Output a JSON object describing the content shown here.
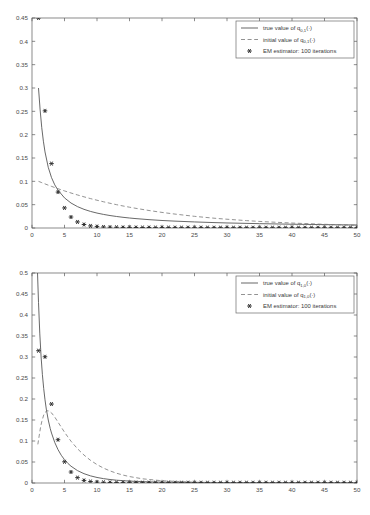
{
  "page": {
    "background": "#ffffff",
    "width": 370,
    "height": 515
  },
  "figures": [
    {
      "id": "figure-1",
      "legend": {
        "entries": [
          {
            "label_prefix": "true value of q",
            "subscript": "0,1",
            "label_suffix": "(·)",
            "marker": "solid-line"
          },
          {
            "label_prefix": "initial value of q",
            "subscript": "0,1",
            "label_suffix": "(·)",
            "marker": "dashed-line"
          },
          {
            "label_prefix": "EM estimator: 100 iterations",
            "subscript": "",
            "label_suffix": "",
            "marker": "star-point"
          }
        ]
      }
    },
    {
      "id": "figure-2",
      "legend": {
        "entries": [
          {
            "label_prefix": "true value of q",
            "subscript": "1,0",
            "label_suffix": "(·)",
            "marker": "solid-line"
          },
          {
            "label_prefix": "initial value of q",
            "subscript": "1,0",
            "label_suffix": "(·)",
            "marker": "dashed-line"
          },
          {
            "label_prefix": "EM estimator: 100 iterations",
            "subscript": "",
            "label_suffix": "",
            "marker": "star-point"
          }
        ]
      }
    }
  ],
  "chart_data": [
    {
      "type": "line",
      "title": "",
      "xlabel": "",
      "ylabel": "",
      "xlim": [
        0,
        50
      ],
      "ylim": [
        0,
        0.45
      ],
      "xticks": [
        0,
        5,
        10,
        15,
        20,
        25,
        30,
        35,
        40,
        45,
        50
      ],
      "yticks": [
        0,
        0.05,
        0.1,
        0.15,
        0.2,
        0.25,
        0.3,
        0.35,
        0.4,
        0.45
      ],
      "grid": false,
      "legend_position": "top-right",
      "colors": {
        "true": "#4d4d4d",
        "initial": "#777777",
        "estimator": "#2b2b2b"
      },
      "series": [
        {
          "name": "true value of q_{0,1}(·)",
          "style": "solid",
          "x": [
            1,
            1.25,
            1.5,
            1.75,
            2,
            2.5,
            3,
            3.5,
            4,
            5,
            6,
            7,
            8,
            9,
            10,
            11,
            12,
            13,
            14,
            15,
            16,
            18,
            20,
            22,
            25,
            28,
            30,
            35,
            40,
            45,
            50
          ],
          "y": [
            0.3,
            0.253,
            0.215,
            0.186,
            0.163,
            0.13,
            0.108,
            0.0925,
            0.081,
            0.0645,
            0.0535,
            0.0458,
            0.04,
            0.0355,
            0.032,
            0.0291,
            0.0267,
            0.0247,
            0.0229,
            0.0214,
            0.0201,
            0.0179,
            0.0161,
            0.0147,
            0.013,
            0.0116,
            0.0108,
            0.0093,
            0.0081,
            0.0072,
            0.0065
          ]
        },
        {
          "name": "initial value of q_{0,1}(·)",
          "style": "dashed",
          "x": [
            1,
            1.5,
            2,
            2.5,
            3,
            4,
            5,
            6,
            7,
            8,
            9,
            10,
            11,
            12,
            13,
            14,
            15,
            16,
            18,
            20,
            22,
            25,
            28,
            30,
            33,
            36,
            40,
            44,
            47,
            50
          ],
          "y": [
            0.1,
            0.0972,
            0.0945,
            0.0918,
            0.0892,
            0.0842,
            0.0795,
            0.075,
            0.0708,
            0.0668,
            0.063,
            0.0595,
            0.0562,
            0.053,
            0.05,
            0.0472,
            0.0446,
            0.0421,
            0.0375,
            0.0334,
            0.0298,
            0.025,
            0.021,
            0.0188,
            0.0158,
            0.0133,
            0.0106,
            0.0084,
            0.007,
            0.0059
          ]
        },
        {
          "name": "EM estimator: 100 iterations",
          "style": "points",
          "x": [
            1,
            2,
            3,
            4,
            5,
            6,
            7,
            8,
            9,
            10,
            11,
            12,
            13,
            14,
            15,
            16,
            17,
            18,
            19,
            20,
            21,
            22,
            23,
            24,
            25,
            26,
            27,
            28,
            29,
            30,
            31,
            32,
            33,
            34,
            35,
            36,
            37,
            38,
            39,
            40,
            41,
            42,
            43,
            44,
            45,
            46,
            47,
            48,
            49,
            50
          ],
          "y": [
            0.45,
            0.251,
            0.138,
            0.077,
            0.043,
            0.0235,
            0.013,
            0.0075,
            0.0045,
            0.003,
            0.0022,
            0.0018,
            0.0015,
            0.0013,
            0.0012,
            0.0011,
            0.001,
            0.001,
            0.0009,
            0.0009,
            0.0009,
            0.0008,
            0.0008,
            0.0008,
            0.0008,
            0.0008,
            0.0008,
            0.0007,
            0.0007,
            0.0007,
            0.0007,
            0.0007,
            0.0007,
            0.0007,
            0.0007,
            0.0007,
            0.0007,
            0.0007,
            0.0007,
            0.0007,
            0.0007,
            0.0007,
            0.0007,
            0.0007,
            0.0007,
            0.0007,
            0.0007,
            0.0007,
            0.0007,
            0.0007
          ]
        }
      ]
    },
    {
      "type": "line",
      "title": "",
      "xlabel": "",
      "ylabel": "",
      "xlim": [
        0,
        50
      ],
      "ylim": [
        0,
        0.5
      ],
      "xticks": [
        0,
        5,
        10,
        15,
        20,
        25,
        30,
        35,
        40,
        45,
        50
      ],
      "yticks": [
        0,
        0.05,
        0.1,
        0.15,
        0.2,
        0.25,
        0.3,
        0.35,
        0.4,
        0.45,
        0.5
      ],
      "grid": false,
      "legend_position": "top-right",
      "colors": {
        "true": "#4d4d4d",
        "initial": "#777777",
        "estimator": "#2b2b2b"
      },
      "series": [
        {
          "name": "true value of q_{1,0}(·)",
          "style": "solid",
          "x": [
            0.85,
            1,
            1.2,
            1.4,
            1.6,
            1.8,
            2,
            2.2,
            2.5,
            2.8,
            3,
            3.5,
            4,
            4.5,
            5,
            5.5,
            6,
            7,
            8,
            9,
            10,
            11,
            12,
            13,
            15,
            18,
            20,
            25,
            30,
            35,
            40,
            45,
            50
          ],
          "y": [
            0.5,
            0.43,
            0.355,
            0.3,
            0.258,
            0.225,
            0.198,
            0.176,
            0.15,
            0.13,
            0.119,
            0.0965,
            0.0795,
            0.066,
            0.0555,
            0.047,
            0.04,
            0.0295,
            0.0222,
            0.017,
            0.0132,
            0.0104,
            0.0083,
            0.0067,
            0.0045,
            0.0027,
            0.002,
            0.0012,
            0.0008,
            0.0006,
            0.0005,
            0.0004,
            0.0003
          ]
        },
        {
          "name": "initial value of q_{1,0}(·)",
          "style": "dashed",
          "x": [
            0.9,
            1.1,
            1.3,
            1.5,
            1.8,
            2,
            2.3,
            2.6,
            3,
            3.5,
            4,
            4.5,
            5,
            5.5,
            6,
            7,
            8,
            9,
            10,
            11,
            12,
            13,
            14,
            15,
            17,
            20,
            25,
            30,
            35,
            40,
            45,
            50
          ],
          "y": [
            0.092,
            0.112,
            0.131,
            0.146,
            0.162,
            0.168,
            0.172,
            0.1715,
            0.167,
            0.157,
            0.145,
            0.133,
            0.121,
            0.11,
            0.0995,
            0.0815,
            0.0665,
            0.054,
            0.0438,
            0.0355,
            0.0288,
            0.0233,
            0.0189,
            0.0153,
            0.01,
            0.0053,
            0.0019,
            0.0008,
            0.0004,
            0.0003,
            0.0002,
            0.0002
          ]
        },
        {
          "name": "EM estimator: 100 iterations",
          "style": "points",
          "x": [
            1,
            2,
            3,
            4,
            5,
            6,
            7,
            8,
            9,
            10,
            11,
            12,
            13,
            14,
            15,
            16,
            17,
            18,
            19,
            20,
            21,
            22,
            23,
            24,
            25,
            26,
            27,
            28,
            29,
            30,
            31,
            32,
            33,
            34,
            35,
            36,
            37,
            38,
            39,
            40,
            41,
            42,
            43,
            44,
            45,
            46,
            47,
            48,
            49,
            50
          ],
          "y": [
            0.315,
            0.3005,
            0.188,
            0.103,
            0.0505,
            0.0262,
            0.0128,
            0.0062,
            0.0035,
            0.0022,
            0.0016,
            0.0013,
            0.0011,
            0.001,
            0.0009,
            0.0009,
            0.0008,
            0.0008,
            0.0008,
            0.0008,
            0.0008,
            0.0007,
            0.0007,
            0.0007,
            0.0007,
            0.0007,
            0.0007,
            0.0007,
            0.0007,
            0.0007,
            0.0007,
            0.0007,
            0.0007,
            0.0007,
            0.0007,
            0.0007,
            0.0007,
            0.0007,
            0.0007,
            0.0007,
            0.0007,
            0.0007,
            0.0007,
            0.0007,
            0.0007,
            0.0007,
            0.0007,
            0.0007,
            0.0007,
            0.0007
          ]
        }
      ]
    }
  ]
}
